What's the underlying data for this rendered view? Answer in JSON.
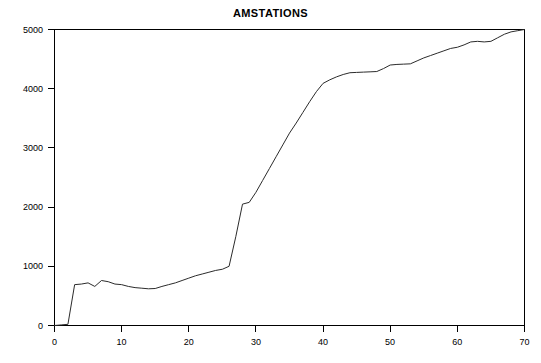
{
  "chart_data": {
    "type": "line",
    "title": "AMSTATIONS",
    "xlabel": "",
    "ylabel": "",
    "xlim": [
      0,
      70
    ],
    "ylim": [
      0,
      5000
    ],
    "xticks": [
      0,
      10,
      20,
      30,
      40,
      50,
      60,
      70
    ],
    "yticks": [
      0,
      1000,
      2000,
      3000,
      4000,
      5000
    ],
    "grid": false,
    "legend": null,
    "line_color": "#2b2b2b",
    "background": "#ffffff",
    "series": [
      {
        "name": "AMSTATIONS",
        "x": [
          0,
          1,
          2,
          3,
          4,
          5,
          6,
          7,
          8,
          9,
          10,
          11,
          12,
          13,
          14,
          15,
          16,
          17,
          18,
          19,
          20,
          21,
          22,
          23,
          24,
          25,
          26,
          27,
          28,
          29,
          30,
          31,
          32,
          33,
          34,
          35,
          36,
          37,
          38,
          39,
          40,
          41,
          42,
          43,
          44,
          45,
          46,
          47,
          48,
          49,
          50,
          51,
          52,
          53,
          54,
          55,
          56,
          57,
          58,
          59,
          60,
          61,
          62,
          63,
          64,
          65,
          66,
          67,
          68,
          69,
          70
        ],
        "y": [
          0,
          10,
          20,
          690,
          700,
          720,
          660,
          760,
          740,
          700,
          690,
          660,
          640,
          630,
          620,
          625,
          660,
          690,
          720,
          760,
          800,
          840,
          870,
          900,
          930,
          950,
          1000,
          1500,
          2050,
          2080,
          2250,
          2450,
          2650,
          2850,
          3050,
          3250,
          3420,
          3600,
          3780,
          3950,
          4090,
          4150,
          4200,
          4240,
          4270,
          4275,
          4280,
          4285,
          4290,
          4340,
          4400,
          4410,
          4415,
          4420,
          4470,
          4520,
          4560,
          4600,
          4640,
          4680,
          4700,
          4740,
          4790,
          4800,
          4790,
          4800,
          4860,
          4920,
          4960,
          4980,
          5000
        ]
      }
    ]
  },
  "axes": {
    "y_tick_labels": [
      "0",
      "1000",
      "2000",
      "3000",
      "4000",
      "5000"
    ],
    "x_tick_labels": [
      "0",
      "10",
      "20",
      "30",
      "40",
      "50",
      "60",
      "70"
    ]
  }
}
